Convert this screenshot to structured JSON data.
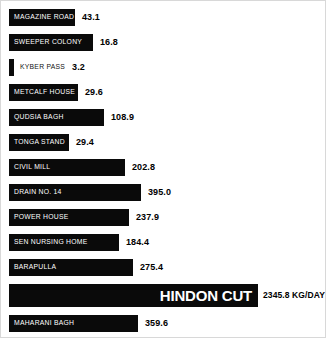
{
  "chart_data": {
    "type": "bar",
    "title": "",
    "subtitle": "",
    "xlabel": "",
    "ylabel": "",
    "orientation": "horizontal",
    "grid": false,
    "legend": false,
    "unit_label": "KG/DAY",
    "categories": [
      "MAGAZINE ROAD",
      "SWEEPER COLONY",
      "KYBER PASS",
      "METCALF HOUSE",
      "QUDSIA BAGH",
      "TONGA STAND",
      "CIVIL MILL",
      "DRAIN NO. 14",
      "POWER HOUSE",
      "SEN NURSING HOME",
      "BARAPULLA",
      "HINDON CUT",
      "MAHARANI BAGH"
    ],
    "values": [
      43.1,
      16.8,
      3.2,
      29.6,
      108.9,
      29.4,
      202.8,
      395.0,
      237.9,
      184.4,
      275.4,
      2345.8,
      359.6
    ],
    "value_labels": [
      "43.1",
      "16.8",
      "3.2",
      "29.6",
      "108.9",
      "29.4",
      "202.8",
      "395.0",
      "237.9",
      "184.4",
      "275.4",
      "2345.8 KG/DAY",
      "359.6"
    ],
    "bar_color": "#0a0a0a",
    "label_color_inside": "#ffffff",
    "value_color": "#000000",
    "highlight_category": "HINDON CUT"
  },
  "rows": [
    {
      "label": "MAGAZINE ROAD",
      "value": "43.1",
      "bar_px": 66,
      "label_outside": false,
      "highlight": false
    },
    {
      "label": "SWEEPER COLONY",
      "value": "16.8",
      "bar_px": 84,
      "label_outside": false,
      "highlight": false
    },
    {
      "label": "KYBER PASS",
      "value": "3.2",
      "bar_px": 5,
      "label_outside": true,
      "highlight": false
    },
    {
      "label": "METCALF HOUSE",
      "value": "29.6",
      "bar_px": 69,
      "label_outside": false,
      "highlight": false
    },
    {
      "label": "QUDSIA BAGH",
      "value": "108.9",
      "bar_px": 95,
      "label_outside": false,
      "highlight": false
    },
    {
      "label": "TONGA STAND",
      "value": "29.4",
      "bar_px": 60,
      "label_outside": false,
      "highlight": false
    },
    {
      "label": "CIVIL MILL",
      "value": "202.8",
      "bar_px": 116,
      "label_outside": false,
      "highlight": false
    },
    {
      "label": "DRAIN NO. 14",
      "value": "395.0",
      "bar_px": 132,
      "label_outside": false,
      "highlight": false
    },
    {
      "label": "POWER HOUSE",
      "value": "237.9",
      "bar_px": 120,
      "label_outside": false,
      "highlight": false
    },
    {
      "label": "SEN NURSING HOME",
      "value": "184.4",
      "bar_px": 110,
      "label_outside": false,
      "highlight": false
    },
    {
      "label": "BARAPULLA",
      "value": "275.4",
      "bar_px": 124,
      "label_outside": false,
      "highlight": false
    },
    {
      "label": "HINDON CUT",
      "value": "2345.8 KG/DAY",
      "bar_px": 249,
      "label_outside": false,
      "highlight": true
    },
    {
      "label": "MAHARANI BAGH",
      "value": "359.6",
      "bar_px": 129,
      "label_outside": false,
      "highlight": false
    }
  ]
}
